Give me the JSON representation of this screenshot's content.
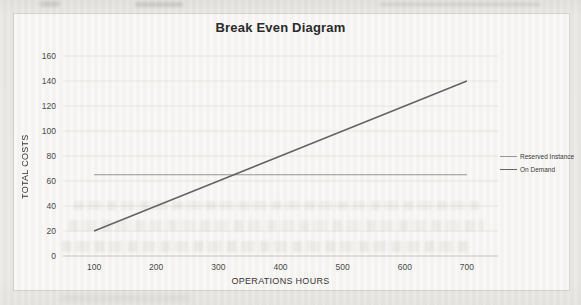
{
  "chart_data": {
    "type": "line",
    "title": "Break Even Diagram",
    "xlabel": "OPERATIONS HOURS",
    "ylabel": "TOTAL COSTS",
    "x": [
      100,
      200,
      300,
      400,
      500,
      600,
      700
    ],
    "series": [
      {
        "name": "Reserved Instance",
        "values": [
          65,
          65,
          65,
          65,
          65,
          65,
          65
        ],
        "color": "#949494",
        "stroke_width": 1.1
      },
      {
        "name": "On Demand",
        "values": [
          20,
          40,
          60,
          80,
          100,
          120,
          140
        ],
        "color": "#5f5f5f",
        "stroke_width": 1.5
      }
    ],
    "xlim": [
      50,
      750
    ],
    "ylim": [
      0,
      160
    ],
    "xticks": [
      100,
      200,
      300,
      400,
      500,
      600,
      700
    ],
    "yticks": [
      0,
      20,
      40,
      60,
      80,
      100,
      120,
      140,
      160
    ],
    "grid": "horizontal",
    "legend_position": "right",
    "break_even_point": {
      "x": 325,
      "y": 65
    },
    "colors": {
      "gridline": "#e8e6e2",
      "axis_line": "#c6c4bf",
      "tick_text": "#454545",
      "title_text": "#242424",
      "frame_border": "#d4d3ce",
      "chart_background": "#f9f8f6",
      "paper_background": "#e9e8e5"
    }
  }
}
